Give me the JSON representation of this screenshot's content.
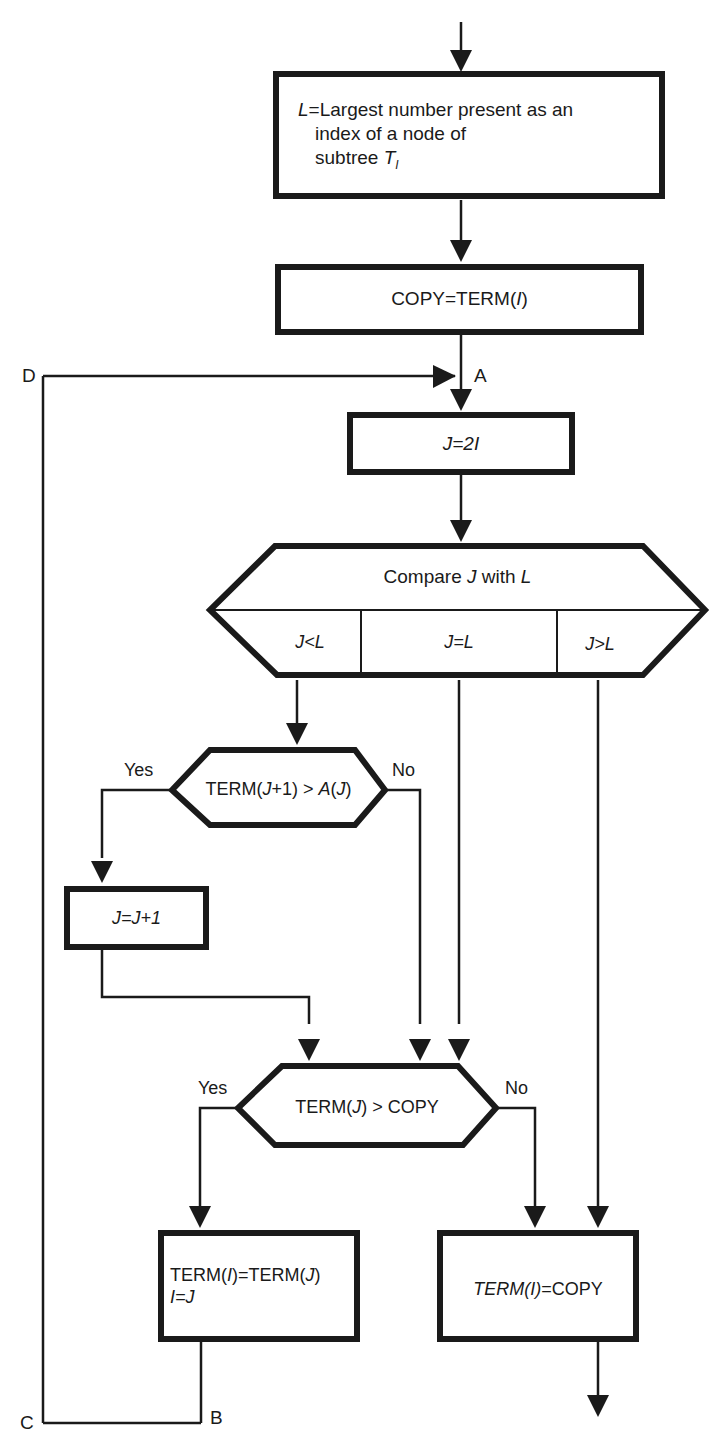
{
  "diagram": {
    "type": "flowchart",
    "colors": {
      "stroke": "#1a1a1a",
      "background": "#ffffff"
    },
    "nodes": {
      "define_L": {
        "shape": "rectangle",
        "line1_var": "L",
        "line1_rest": "=Largest number present as an",
        "line2": "index of a node of",
        "line3_prefix": "subtree ",
        "line3_var": "T",
        "line3_sub": "I"
      },
      "copy_term": {
        "shape": "rectangle",
        "text_prefix": "COPY=TERM(",
        "text_var": "I",
        "text_suffix": ")"
      },
      "set_J": {
        "shape": "rectangle",
        "text": "J=2I"
      },
      "compare": {
        "shape": "multiway-decision",
        "title_prefix": "Compare ",
        "title_var1": "J",
        "title_mid": " with ",
        "title_var2": "L",
        "branches": [
          "J<L",
          "J=L",
          "J>L"
        ]
      },
      "decision_term_j1": {
        "shape": "hexagon-decision",
        "text_prefix": "TERM(",
        "text_var": "J",
        "text_mid": "+1) > ",
        "text_var2": "A",
        "text_paren": "(",
        "text_var3": "J",
        "text_end": ")",
        "yes_label": "Yes",
        "no_label": "No"
      },
      "increment_J": {
        "shape": "rectangle",
        "text": "J=J+1"
      },
      "decision_term_copy": {
        "shape": "hexagon-decision",
        "text_prefix": "TERM(",
        "text_var": "J",
        "text_suffix": ") > COPY",
        "yes_label": "Yes",
        "no_label": "No"
      },
      "assign_term": {
        "shape": "rectangle",
        "line1_prefix": "TERM(",
        "line1_var": "I",
        "line1_mid": ")=TERM(",
        "line1_var2": "J",
        "line1_end": ")",
        "line2": "I=J"
      },
      "final_assign": {
        "shape": "rectangle",
        "text_italic": "TERM(I)",
        "text_rest": "=COPY"
      }
    },
    "connectors": {
      "A": "A",
      "B": "B",
      "C": "C",
      "D": "D"
    }
  }
}
